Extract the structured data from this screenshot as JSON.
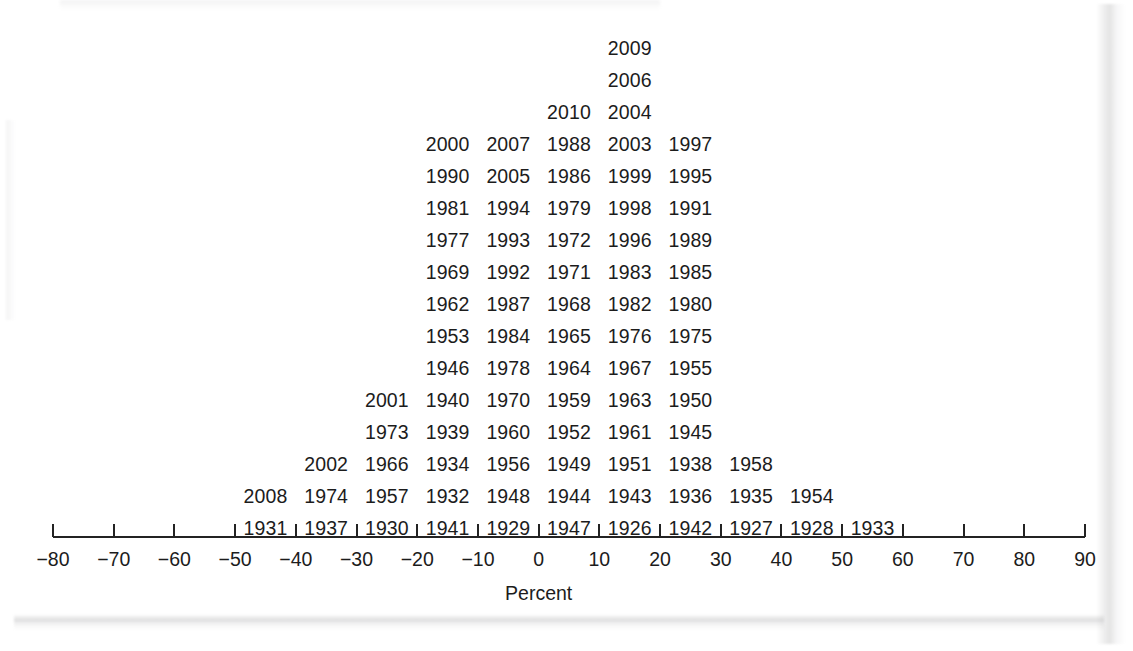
{
  "figure": {
    "kind": "stacked-year-dotplot",
    "background_color": "#ffffff",
    "ink_color": "#1c1c1c"
  },
  "chart_data": {
    "type": "bar",
    "title": "",
    "subtitle": "",
    "xlabel": "Percent",
    "ylabel": "",
    "xlim": [
      -80,
      90
    ],
    "ylim": [
      0,
      17
    ],
    "grid": false,
    "legend": null,
    "tick_step": 10,
    "bin_width": 10,
    "xticks": [
      -80,
      -70,
      -60,
      -50,
      -40,
      -30,
      -20,
      -10,
      0,
      10,
      20,
      30,
      40,
      50,
      60,
      70,
      80,
      90
    ],
    "xticklabels": [
      "−80",
      "−70",
      "−60",
      "−50",
      "−40",
      "−30",
      "−20",
      "−10",
      "0",
      "10",
      "20",
      "30",
      "40",
      "50",
      "60",
      "70",
      "80",
      "90"
    ],
    "categories": [
      "−45",
      "−35",
      "−25",
      "−15",
      "−5",
      "5",
      "15",
      "25",
      "35",
      "45",
      "55"
    ],
    "bin_centers": [
      -45,
      -35,
      -25,
      -15,
      -5,
      5,
      15,
      25,
      35,
      45,
      55
    ],
    "values": [
      1,
      2,
      4,
      5,
      14,
      14,
      16,
      14,
      5,
      3,
      1
    ],
    "stacks": [
      {
        "center": -45,
        "count": 1,
        "labels": [
          "1931"
        ]
      },
      {
        "center": -35,
        "count": 2,
        "labels": [
          "1937",
          "2008"
        ]
      },
      {
        "center": -25,
        "count": 4,
        "labels": [
          "1930",
          "1974",
          "2002",
          "1973"
        ]
      },
      {
        "center": -15,
        "count": 5,
        "labels": [
          "1941",
          "1957",
          "1966",
          "2001",
          "1940"
        ]
      },
      {
        "center": -5,
        "count": 14,
        "labels": [
          "1929",
          "1932",
          "1934",
          "1939",
          "1940",
          "1946",
          "1953",
          "1962",
          "1969",
          "1977",
          "1981",
          "1990",
          "2000",
          "1973"
        ]
      },
      {
        "center": 5,
        "count": 14,
        "labels": [
          "1947",
          "1948",
          "1956",
          "1966",
          "1970",
          "1978",
          "1984",
          "1987",
          "1992",
          "1993",
          "1994",
          "2005",
          "2007",
          "1939"
        ]
      },
      {
        "center": 15,
        "count": 16,
        "labels": [
          "1926",
          "1944",
          "1949",
          "1934",
          "1960",
          "1959",
          "1964",
          "1965",
          "1968",
          "1971",
          "1972",
          "1979",
          "1986",
          "1988",
          "2010",
          "1957"
        ]
      },
      {
        "center": 25,
        "count": 14,
        "labels": [
          "1942",
          "1943",
          "1951",
          "1952",
          "1956",
          "1959",
          "1967",
          "1976",
          "1982",
          "1983",
          "1996",
          "1998",
          "1999",
          "2003"
        ]
      },
      {
        "center": 35,
        "count": 5,
        "labels": [
          "1927",
          "1936",
          "1938",
          "1961",
          "1963"
        ]
      },
      {
        "center": 45,
        "count": 3,
        "labels": [
          "1928",
          "1935",
          "1958"
        ]
      },
      {
        "center": 55,
        "count": 1,
        "labels": [
          "1933"
        ]
      }
    ],
    "rows": [
      {
        "y_index": 16,
        "cells": [
          {
            "center": 15,
            "label": "2009"
          }
        ]
      },
      {
        "y_index": 15,
        "cells": [
          {
            "center": 15,
            "label": "2006"
          }
        ]
      },
      {
        "y_index": 14,
        "cells": [
          {
            "center": 5,
            "label": "2010"
          },
          {
            "center": 15,
            "label": "2004"
          }
        ]
      },
      {
        "y_index": 13,
        "cells": [
          {
            "center": -15,
            "label": "2000"
          },
          {
            "center": -5,
            "label": "2007"
          },
          {
            "center": 5,
            "label": "1988"
          },
          {
            "center": 15,
            "label": "2003"
          },
          {
            "center": 25,
            "label": "1997"
          }
        ]
      },
      {
        "y_index": 12,
        "cells": [
          {
            "center": -15,
            "label": "1990"
          },
          {
            "center": -5,
            "label": "2005"
          },
          {
            "center": 5,
            "label": "1986"
          },
          {
            "center": 15,
            "label": "1999"
          },
          {
            "center": 25,
            "label": "1995"
          }
        ]
      },
      {
        "y_index": 11,
        "cells": [
          {
            "center": -15,
            "label": "1981"
          },
          {
            "center": -5,
            "label": "1994"
          },
          {
            "center": 5,
            "label": "1979"
          },
          {
            "center": 15,
            "label": "1998"
          },
          {
            "center": 25,
            "label": "1991"
          }
        ]
      },
      {
        "y_index": 10,
        "cells": [
          {
            "center": -15,
            "label": "1977"
          },
          {
            "center": -5,
            "label": "1993"
          },
          {
            "center": 5,
            "label": "1972"
          },
          {
            "center": 15,
            "label": "1996"
          },
          {
            "center": 25,
            "label": "1989"
          }
        ]
      },
      {
        "y_index": 9,
        "cells": [
          {
            "center": -15,
            "label": "1969"
          },
          {
            "center": -5,
            "label": "1992"
          },
          {
            "center": 5,
            "label": "1971"
          },
          {
            "center": 15,
            "label": "1983"
          },
          {
            "center": 25,
            "label": "1985"
          }
        ]
      },
      {
        "y_index": 8,
        "cells": [
          {
            "center": -15,
            "label": "1962"
          },
          {
            "center": -5,
            "label": "1987"
          },
          {
            "center": 5,
            "label": "1968"
          },
          {
            "center": 15,
            "label": "1982"
          },
          {
            "center": 25,
            "label": "1980"
          }
        ]
      },
      {
        "y_index": 7,
        "cells": [
          {
            "center": -15,
            "label": "1953"
          },
          {
            "center": -5,
            "label": "1984"
          },
          {
            "center": 5,
            "label": "1965"
          },
          {
            "center": 15,
            "label": "1976"
          },
          {
            "center": 25,
            "label": "1975"
          }
        ]
      },
      {
        "y_index": 6,
        "cells": [
          {
            "center": -15,
            "label": "1946"
          },
          {
            "center": -5,
            "label": "1978"
          },
          {
            "center": 5,
            "label": "1964"
          },
          {
            "center": 15,
            "label": "1967"
          },
          {
            "center": 25,
            "label": "1955"
          }
        ]
      },
      {
        "y_index": 5,
        "cells": [
          {
            "center": -25,
            "label": "2001"
          },
          {
            "center": -15,
            "label": "1940"
          },
          {
            "center": -5,
            "label": "1970"
          },
          {
            "center": 5,
            "label": "1959"
          },
          {
            "center": 15,
            "label": "1963"
          },
          {
            "center": 25,
            "label": "1950"
          }
        ]
      },
      {
        "y_index": 4,
        "cells": [
          {
            "center": -25,
            "label": "1973"
          },
          {
            "center": -15,
            "label": "1939"
          },
          {
            "center": -5,
            "label": "1960"
          },
          {
            "center": 5,
            "label": "1952"
          },
          {
            "center": 15,
            "label": "1961"
          },
          {
            "center": 25,
            "label": "1945"
          }
        ]
      },
      {
        "y_index": 3,
        "cells": [
          {
            "center": -35,
            "label": "2002"
          },
          {
            "center": -25,
            "label": "1966"
          },
          {
            "center": -15,
            "label": "1934"
          },
          {
            "center": -5,
            "label": "1956"
          },
          {
            "center": 5,
            "label": "1949"
          },
          {
            "center": 15,
            "label": "1951"
          },
          {
            "center": 25,
            "label": "1938"
          },
          {
            "center": 35,
            "label": "1958"
          }
        ]
      },
      {
        "y_index": 2,
        "cells": [
          {
            "center": -45,
            "label": "2008"
          },
          {
            "center": -35,
            "label": "1974"
          },
          {
            "center": -25,
            "label": "1957"
          },
          {
            "center": -15,
            "label": "1932"
          },
          {
            "center": -5,
            "label": "1948"
          },
          {
            "center": 5,
            "label": "1944"
          },
          {
            "center": 15,
            "label": "1943"
          },
          {
            "center": 25,
            "label": "1936"
          },
          {
            "center": 35,
            "label": "1935"
          },
          {
            "center": 45,
            "label": "1954"
          }
        ]
      },
      {
        "y_index": 1,
        "cells": [
          {
            "center": -45,
            "label": "1931"
          },
          {
            "center": -35,
            "label": "1937"
          },
          {
            "center": -25,
            "label": "1930"
          },
          {
            "center": -15,
            "label": "1941"
          },
          {
            "center": -5,
            "label": "1929"
          },
          {
            "center": 5,
            "label": "1947"
          },
          {
            "center": 15,
            "label": "1926"
          },
          {
            "center": 25,
            "label": "1942"
          },
          {
            "center": 35,
            "label": "1927"
          },
          {
            "center": 45,
            "label": "1928"
          },
          {
            "center": 55,
            "label": "1933"
          }
        ]
      }
    ]
  }
}
